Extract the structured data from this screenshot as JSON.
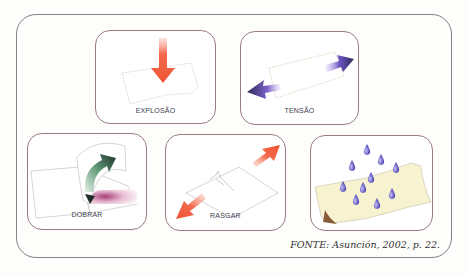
{
  "figure": {
    "panels": [
      {
        "id": "explosao",
        "label": "EXPLOSÃO",
        "arrow_color": "#f05a3c"
      },
      {
        "id": "tensao",
        "label": "TENSÃO",
        "arrow_color": "#4a3f9a"
      },
      {
        "id": "dobrar",
        "label": "DOBRAR",
        "arrow_color": "#2f5f45"
      },
      {
        "id": "rasgar",
        "label": "RASGAR",
        "arrow_color": "#f05a3c"
      },
      {
        "id": "umidade",
        "label": "",
        "drop_color": "#6a62c8",
        "paper_color": "#f7f3d0"
      }
    ],
    "source": "FONTE: Asunción, 2002, p. 22."
  }
}
